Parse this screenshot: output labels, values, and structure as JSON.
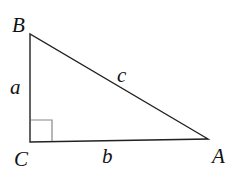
{
  "diagram": {
    "type": "right-triangle",
    "vertices": {
      "B": {
        "label": "B",
        "x": 30,
        "y": 34
      },
      "C": {
        "label": "C",
        "x": 30,
        "y": 142
      },
      "A": {
        "label": "A",
        "x": 208,
        "y": 139
      }
    },
    "sides": {
      "a": {
        "label": "a",
        "between": [
          "B",
          "C"
        ]
      },
      "b": {
        "label": "b",
        "between": [
          "C",
          "A"
        ]
      },
      "c": {
        "label": "c",
        "between": [
          "B",
          "A"
        ]
      }
    },
    "right_angle_at": "C",
    "colors": {
      "stroke": "#222222",
      "right_angle_marker": "#888888"
    }
  }
}
